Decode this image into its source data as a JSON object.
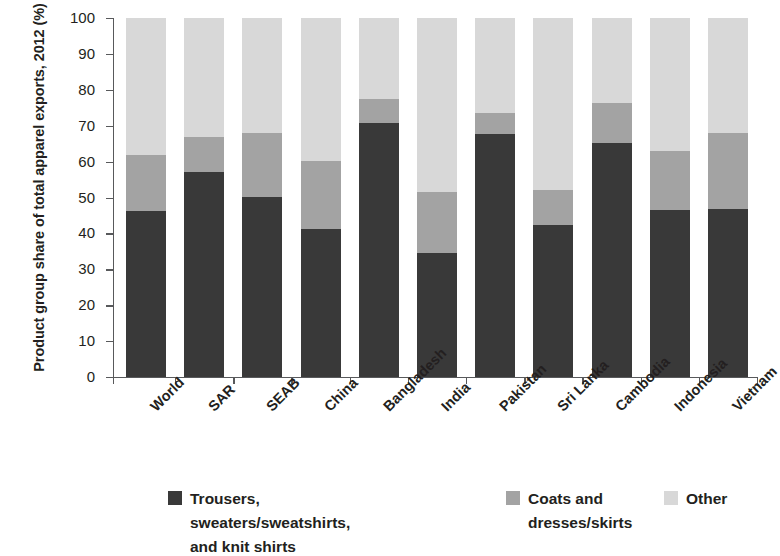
{
  "chart_data": {
    "type": "bar",
    "subtype": "stacked-bar-100",
    "title": "",
    "xlabel": "",
    "ylabel": "Product group share of total apparel exports, 2012 (%)",
    "ylim": [
      0,
      100
    ],
    "yticks": [
      0,
      10,
      20,
      30,
      40,
      50,
      60,
      70,
      80,
      90,
      100
    ],
    "ytick_labels": [
      "0",
      "10",
      "20",
      "30",
      "40",
      "50",
      "60",
      "70",
      "80",
      "90",
      "100"
    ],
    "grid": false,
    "legend_position": "bottom",
    "categories": [
      "World",
      "SAR",
      "SEAB",
      "China",
      "Bangladesh",
      "India",
      "Pakistan",
      "Sri Lanka",
      "Cambodia",
      "Indonesia",
      "Vietnam"
    ],
    "series": [
      {
        "name": "Trousers, sweaters/sweatshirts, and knit shirts",
        "color": "#393939",
        "values": [
          46.2,
          57.2,
          50.1,
          41.2,
          70.8,
          34.6,
          67.7,
          42.4,
          65.3,
          46.4,
          46.8
        ]
      },
      {
        "name": "Coats and dresses/skirts",
        "color": "#a3a3a3",
        "values": [
          15.6,
          9.6,
          17.8,
          18.9,
          6.7,
          17.0,
          5.9,
          9.6,
          10.9,
          16.5,
          21.1
        ]
      },
      {
        "name": "Other",
        "color": "#d8d8d8",
        "values": [
          38.2,
          33.2,
          32.1,
          39.9,
          22.5,
          48.4,
          26.4,
          48.0,
          23.8,
          37.1,
          32.1
        ]
      }
    ],
    "stack_tops": {
      "series_0": [
        46.2,
        57.2,
        50.1,
        41.2,
        70.8,
        34.6,
        67.7,
        42.4,
        65.3,
        46.4,
        46.8
      ],
      "series_1": [
        61.8,
        66.8,
        67.9,
        60.1,
        77.5,
        51.6,
        73.6,
        52.0,
        76.2,
        62.9,
        67.9
      ],
      "series_2": [
        100,
        100,
        100,
        100,
        100,
        100,
        100,
        100,
        100,
        100,
        100
      ]
    }
  },
  "legend": {
    "items": [
      {
        "label": "Trousers, sweaters/sweatshirts,\nand knit shirts",
        "color": "#393939"
      },
      {
        "label": "Coats and\ndresses/skirts",
        "color": "#a3a3a3"
      },
      {
        "label": "Other",
        "color": "#d8d8d8"
      }
    ]
  },
  "axis": {
    "y_title": "Product group share of total apparel exports, 2012 (%)"
  }
}
